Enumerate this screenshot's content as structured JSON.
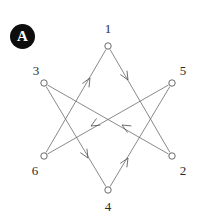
{
  "figure": {
    "panel_label": "A",
    "background_color": "#ffffff",
    "line_color": "#6b6b6b",
    "node_color": "#5a5a5a",
    "badge_color": "#0d0d0d",
    "badge_text_color": "#ffffff",
    "width": 202,
    "height": 216
  },
  "chart_data": {
    "type": "diagram",
    "title": "",
    "subtitle": "",
    "nodes": [
      {
        "id": "1",
        "label": "1",
        "x": 108,
        "y": 46,
        "label_x": 108,
        "label_y": 28,
        "radius": 3.2
      },
      {
        "id": "3",
        "label": "3",
        "x": 44,
        "y": 83,
        "label_x": 36,
        "label_y": 70,
        "radius": 3.2
      },
      {
        "id": "5",
        "label": "5",
        "x": 172,
        "y": 83,
        "label_x": 183,
        "label_y": 70,
        "radius": 3.2
      },
      {
        "id": "6",
        "label": "6",
        "x": 44,
        "y": 156,
        "label_x": 35,
        "label_y": 170,
        "radius": 3.2
      },
      {
        "id": "2",
        "label": "2",
        "x": 172,
        "y": 156,
        "label_x": 183,
        "label_y": 170,
        "radius": 3.2
      },
      {
        "id": "4",
        "label": "4",
        "x": 108,
        "y": 190,
        "label_x": 108,
        "label_y": 206,
        "radius": 3.2
      }
    ],
    "edges": [
      {
        "from": "6",
        "to": "1",
        "arrow_x": 90,
        "arrow_y": 78,
        "directed": true
      },
      {
        "from": "1",
        "to": "2",
        "arrow_x": 128,
        "arrow_y": 80,
        "directed": true
      },
      {
        "from": "2",
        "to": "3",
        "arrow_x": 122,
        "arrow_y": 125,
        "directed": true
      },
      {
        "from": "3",
        "to": "4",
        "arrow_x": 88,
        "arrow_y": 158,
        "directed": true
      },
      {
        "from": "4",
        "to": "5",
        "arrow_x": 128,
        "arrow_y": 158,
        "directed": true
      },
      {
        "from": "5",
        "to": "6",
        "arrow_x": 91,
        "arrow_y": 126,
        "directed": true
      }
    ],
    "legend": [],
    "xlabel": "",
    "ylabel": ""
  }
}
